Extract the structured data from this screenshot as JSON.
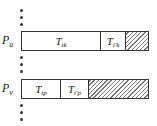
{
  "diagram": {
    "rows": [
      {
        "processor": {
          "main": "P",
          "sub": "u"
        },
        "segments": [
          {
            "main": "T",
            "sub": "i",
            "subsub": "k",
            "prime": false
          },
          {
            "main": "T",
            "sub": "i'",
            "subsub": "k",
            "prime": true
          },
          {
            "hatched": true
          }
        ]
      },
      {
        "processor": {
          "main": "P",
          "sub": "v"
        },
        "segments": [
          {
            "main": "T",
            "sub": "i",
            "subsub": "p",
            "prime": false
          },
          {
            "main": "T",
            "sub": "i'",
            "subsub": "p",
            "prime": true
          },
          {
            "hatched": true
          }
        ]
      }
    ],
    "ellipsis": "⋮",
    "colors": {
      "line": "#333333",
      "hatch": "#777777",
      "background": "#ffffff"
    }
  }
}
